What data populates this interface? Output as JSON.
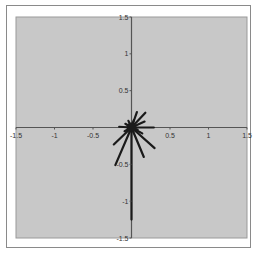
{
  "chart_data": {
    "type": "scatter",
    "subtype": "vector-plot",
    "title": "",
    "xlabel": "",
    "ylabel": "",
    "xlim": [
      -1.5,
      1.5
    ],
    "ylim": [
      -1.5,
      1.5
    ],
    "grid": false,
    "legend": null,
    "x_ticks": [
      "-1.5",
      "-1",
      "-0.5",
      "0.5",
      "1",
      "1.5"
    ],
    "x_tick_values": [
      -1.5,
      -1,
      -0.5,
      0.5,
      1,
      1.5
    ],
    "y_ticks": [
      "1.5",
      "1",
      "0.5",
      "-0.5",
      "-1",
      "-1.5"
    ],
    "y_tick_values": [
      1.5,
      1,
      0.5,
      -0.5,
      -1,
      -1.5
    ],
    "origin": [
      0,
      0
    ],
    "vectors": [
      {
        "x": 0.18,
        "y": 0.2
      },
      {
        "x": 0.07,
        "y": 0.21
      },
      {
        "x": 0.17,
        "y": 0.08
      },
      {
        "x": 0.29,
        "y": 0.0
      },
      {
        "x": 0.3,
        "y": -0.28
      },
      {
        "x": 0.14,
        "y": -0.08
      },
      {
        "x": 0.16,
        "y": -0.4
      },
      {
        "x": 0.0,
        "y": -1.25
      },
      {
        "x": -0.21,
        "y": -0.51
      },
      {
        "x": -0.23,
        "y": -0.23
      },
      {
        "x": -0.16,
        "y": 0.01
      },
      {
        "x": -0.08,
        "y": 0.05
      },
      {
        "x": -0.04,
        "y": 0.09
      },
      {
        "x": 0.03,
        "y": 0.1
      },
      {
        "x": -0.09,
        "y": -0.05
      },
      {
        "x": 0.08,
        "y": -0.03
      }
    ],
    "colors": {
      "plot_background": "#c8c8c8",
      "axis": "#555555",
      "vector": "#1a1a1a",
      "frame": "#8a8a8a"
    }
  }
}
